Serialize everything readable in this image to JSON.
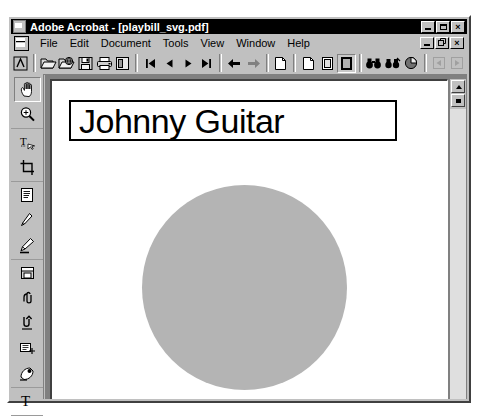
{
  "window": {
    "title": "Adobe Acrobat - [playbill_svg.pdf]",
    "app_name": "Adobe Acrobat",
    "document_name": "playbill_svg.pdf",
    "title_icon": "acrobat-logo-icon",
    "buttons": {
      "minimize": "_",
      "maximize": "□",
      "close": "×"
    }
  },
  "mdi": {
    "doc_icon": "document-icon",
    "buttons": {
      "minimize": "_",
      "restore": "❐",
      "close": "×"
    }
  },
  "menu": {
    "items": [
      {
        "label": "File",
        "mnemonic": "F"
      },
      {
        "label": "Edit",
        "mnemonic": "E"
      },
      {
        "label": "Document",
        "mnemonic": "D"
      },
      {
        "label": "Tools",
        "mnemonic": "T"
      },
      {
        "label": "View",
        "mnemonic": "V"
      },
      {
        "label": "Window",
        "mnemonic": "W"
      },
      {
        "label": "Help",
        "mnemonic": "H"
      }
    ]
  },
  "toolbar": {
    "groups": [
      {
        "buttons": [
          {
            "name": "acrobat-logo-icon",
            "label": "Acrobat"
          }
        ]
      },
      {
        "buttons": [
          {
            "name": "open-folder-icon",
            "label": "Open"
          },
          {
            "name": "open-web-icon",
            "label": "Open Web Page"
          },
          {
            "name": "save-icon",
            "label": "Save"
          },
          {
            "name": "print-icon",
            "label": "Print"
          },
          {
            "name": "page-setup-icon",
            "label": "Page Display"
          }
        ]
      },
      {
        "buttons": [
          {
            "name": "first-page-icon",
            "label": "First Page"
          },
          {
            "name": "previous-page-icon",
            "label": "Previous Page"
          },
          {
            "name": "next-page-icon",
            "label": "Next Page"
          },
          {
            "name": "last-page-icon",
            "label": "Last Page"
          }
        ]
      },
      {
        "buttons": [
          {
            "name": "go-back-icon",
            "label": "Go to Previous View"
          },
          {
            "name": "go-forward-icon",
            "label": "Go to Next View"
          }
        ]
      },
      {
        "buttons": [
          {
            "name": "actual-size-icon",
            "label": "Actual Size"
          }
        ]
      },
      {
        "buttons": [
          {
            "name": "fit-page-icon",
            "label": "Fit in Window"
          },
          {
            "name": "fit-width-icon",
            "label": "Fit Width"
          },
          {
            "name": "fit-visible-icon",
            "label": "Fit Visible",
            "state": "pressed"
          }
        ]
      },
      {
        "buttons": [
          {
            "name": "find-icon",
            "label": "Find"
          },
          {
            "name": "search-icon",
            "label": "Search"
          },
          {
            "name": "web-capture-icon",
            "label": "Web Capture"
          }
        ]
      },
      {
        "buttons": [
          {
            "name": "search-previous-icon",
            "label": "Search Previous",
            "state": "disabled"
          },
          {
            "name": "search-next-icon",
            "label": "Search Next",
            "state": "disabled"
          }
        ]
      }
    ]
  },
  "tool_palette": {
    "tools": [
      {
        "name": "hand-tool-icon",
        "label": "Hand Tool",
        "state": "active"
      },
      {
        "name": "zoom-tool-icon",
        "label": "Zoom In Tool"
      },
      {
        "name": "text-select-tool-icon",
        "label": "Text Select Tool"
      },
      {
        "name": "crop-tool-icon",
        "label": "Crop Tool"
      },
      {
        "name": "note-tool-icon",
        "label": "Notes Tool"
      },
      {
        "name": "pencil-tool-icon",
        "label": "Pencil Tool"
      },
      {
        "name": "highlight-tool-icon",
        "label": "Highlight Tool"
      },
      {
        "name": "stamp-tool-icon",
        "label": "Stamp Tool"
      },
      {
        "name": "attach-tool-icon",
        "label": "File Attachment Tool"
      },
      {
        "name": "link-tool-icon",
        "label": "Link Tool"
      },
      {
        "name": "form-tool-icon",
        "label": "Form Tool"
      },
      {
        "name": "movie-tool-icon",
        "label": "Movie Tool"
      },
      {
        "name": "text-tool-icon",
        "label": "Article Tool"
      }
    ]
  },
  "document": {
    "heading": "Johnny Guitar",
    "shape": {
      "name": "gray-circle",
      "fill": "#b4b4b4"
    }
  },
  "scrollbar": {
    "up_button": "scroll-up-icon",
    "box_button": "scroll-box-icon"
  },
  "colors": {
    "face": "#c0c0c0",
    "titlebar": "#000000",
    "titlebar_text": "#ffffff",
    "page": "#ffffff",
    "circle": "#b4b4b4",
    "client": "#808080"
  }
}
